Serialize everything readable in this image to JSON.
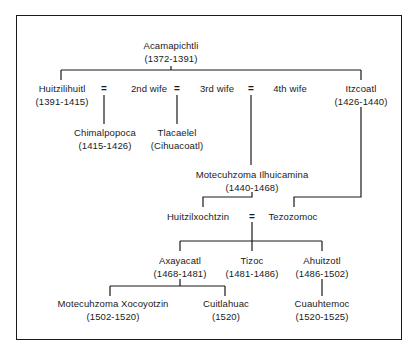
{
  "diagram": {
    "root": {
      "name": "Acamapichtli",
      "dates": "(1372-1391)"
    },
    "generation2": {
      "huitzilihuitl": {
        "name": "Huitzilihuitl",
        "dates": "(1391-1415)"
      },
      "wife2": {
        "name": "2nd wife"
      },
      "wife3": {
        "name": "3rd wife"
      },
      "wife4": {
        "name": "4th wife"
      },
      "itzcoatl": {
        "name": "Itzcoatl",
        "dates": "(1426-1440)"
      },
      "marriage_symbol": "="
    },
    "generation3": {
      "chimalpopoca": {
        "name": "Chimalpopoca",
        "dates": "(1415-1426)"
      },
      "tlacaelel": {
        "name": "Tlacaelel",
        "dates": "(Cihuacoatl)"
      },
      "motecuhzoma1": {
        "name": "Motecuhzoma Ilhuicamina",
        "dates": "(1440-1468)"
      }
    },
    "generation4": {
      "huitzilxochtzin": {
        "name": "Huitzilxochtzin"
      },
      "tezozomoc": {
        "name": "Tezozomoc"
      },
      "marriage_symbol": "="
    },
    "generation5": {
      "axayacatl": {
        "name": "Axayacatl",
        "dates": "(1468-1481)"
      },
      "tizoc": {
        "name": "Tizoc",
        "dates": "(1481-1486)"
      },
      "ahuitzotl": {
        "name": "Ahuitzotl",
        "dates": "(1486-1502)"
      }
    },
    "generation6": {
      "motecuhzoma2": {
        "name": "Motecuhzoma Xocoyotzin",
        "dates": "(1502-1520)"
      },
      "cuitlahuac": {
        "name": "Cuitlahuac",
        "dates": "(1520)"
      },
      "cuauhtemoc": {
        "name": "Cuauhtemoc",
        "dates": "(1520-1525)"
      }
    },
    "colors": {
      "line": "#1a1a1a",
      "text": "#1a1a1a",
      "background": "#ffffff"
    }
  }
}
